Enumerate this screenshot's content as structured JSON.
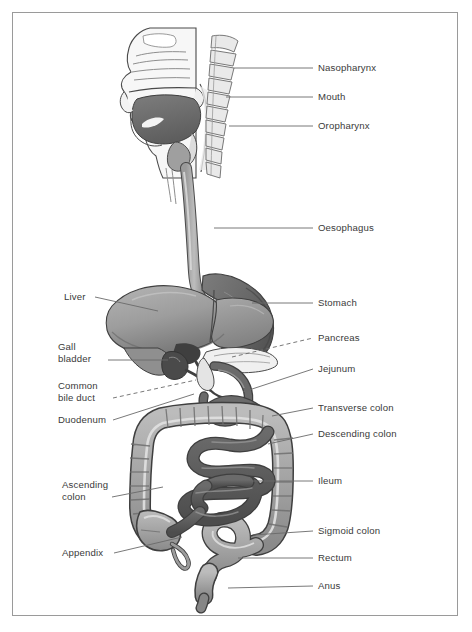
{
  "figure": {
    "frame_color": "#9a9a9a",
    "background": "#ffffff",
    "text_color": "#3a3a3a",
    "leader_color": "#6a6a6a"
  },
  "palette": {
    "colon_light": "#a9a9a9",
    "colon_shade": "#8d8d8d",
    "colon_highlight": "#d9d9d9",
    "ileum_dark": "#5d5d5d",
    "ileum_shade": "#4a4a4a",
    "liver": "#a0a0a0",
    "liver_dark": "#7e7e7e",
    "stomach": "#6f6f6f",
    "stomach_dark": "#5a5a5a",
    "tongue": "#707070",
    "outline": "#4a4a4a",
    "head_fill": "#f2f2f2",
    "vertebra": "#e3e3e3"
  },
  "labels": {
    "right": [
      {
        "id": "nasopharynx",
        "text": "Nasopharynx",
        "x": 318,
        "y": 62,
        "leader": {
          "type": "solid",
          "x1": 234,
          "y1": 68,
          "x2": 313,
          "y2": 68
        }
      },
      {
        "id": "mouth",
        "text": "Mouth",
        "x": 318,
        "y": 91,
        "leader": {
          "type": "solid",
          "x1": 226,
          "y1": 97,
          "x2": 313,
          "y2": 97
        }
      },
      {
        "id": "oropharynx",
        "text": "Oropharynx",
        "x": 318,
        "y": 120,
        "leader": {
          "type": "solid",
          "x1": 229,
          "y1": 126,
          "x2": 313,
          "y2": 126
        }
      },
      {
        "id": "oesophagus",
        "text": "Oesophagus",
        "x": 318,
        "y": 222,
        "leader": {
          "type": "solid",
          "x1": 214,
          "y1": 228,
          "x2": 313,
          "y2": 228
        }
      },
      {
        "id": "stomach",
        "text": "Stomach",
        "x": 318,
        "y": 297,
        "leader": {
          "type": "solid",
          "x1": 252,
          "y1": 303,
          "x2": 313,
          "y2": 303
        }
      },
      {
        "id": "pancreas",
        "text": "Pancreas",
        "x": 318,
        "y": 332,
        "leader": {
          "type": "dashed",
          "x1": 232,
          "y1": 357,
          "x2": 313,
          "y2": 338
        }
      },
      {
        "id": "jejunum",
        "text": "Jejunum",
        "x": 318,
        "y": 363,
        "leader": {
          "type": "solid",
          "x1": 243,
          "y1": 392,
          "x2": 313,
          "y2": 369
        }
      },
      {
        "id": "transverse-colon",
        "text": "Transverse colon",
        "x": 318,
        "y": 402,
        "leader": {
          "type": "solid",
          "x1": 272,
          "y1": 416,
          "x2": 313,
          "y2": 408
        }
      },
      {
        "id": "descending-colon",
        "text": "Descending colon",
        "x": 318,
        "y": 428,
        "leader": {
          "type": "solid",
          "x1": 268,
          "y1": 444,
          "x2": 313,
          "y2": 434
        }
      },
      {
        "id": "ileum",
        "text": "Ileum",
        "x": 318,
        "y": 475,
        "leader": {
          "type": "solid",
          "x1": 252,
          "y1": 481,
          "x2": 313,
          "y2": 481
        }
      },
      {
        "id": "sigmoid-colon",
        "text": "Sigmoid colon",
        "x": 318,
        "y": 525,
        "leader": {
          "type": "solid",
          "x1": 253,
          "y1": 535,
          "x2": 313,
          "y2": 531
        }
      },
      {
        "id": "rectum",
        "text": "Rectum",
        "x": 318,
        "y": 552,
        "leader": {
          "type": "solid",
          "x1": 238,
          "y1": 558,
          "x2": 313,
          "y2": 558
        }
      },
      {
        "id": "anus",
        "text": "Anus",
        "x": 318,
        "y": 580,
        "leader": {
          "type": "solid",
          "x1": 228,
          "y1": 588,
          "x2": 313,
          "y2": 586
        }
      }
    ],
    "left": [
      {
        "id": "liver",
        "text": "Liver",
        "x": 64,
        "y": 291,
        "leader": {
          "type": "solid",
          "x1": 95,
          "y1": 297,
          "x2": 158,
          "y2": 311
        }
      },
      {
        "id": "gall-bladder",
        "text": "Gall\nbladder",
        "x": 58,
        "y": 341,
        "leader": {
          "type": "solid",
          "x1": 108,
          "y1": 360,
          "x2": 168,
          "y2": 360
        }
      },
      {
        "id": "common-bile-duct",
        "text": "Common\nbile duct",
        "x": 58,
        "y": 380,
        "leader": {
          "type": "dashed",
          "x1": 113,
          "y1": 398,
          "x2": 196,
          "y2": 380
        }
      },
      {
        "id": "duodenum",
        "text": "Duodenum",
        "x": 58,
        "y": 414,
        "leader": {
          "type": "solid",
          "x1": 113,
          "y1": 420,
          "x2": 194,
          "y2": 394
        }
      },
      {
        "id": "ascending-colon",
        "text": "Ascending\ncolon",
        "x": 62,
        "y": 479,
        "leader": {
          "type": "solid",
          "x1": 112,
          "y1": 497,
          "x2": 163,
          "y2": 487
        }
      },
      {
        "id": "appendix",
        "text": "Appendix",
        "x": 62,
        "y": 547,
        "leader": {
          "type": "solid",
          "x1": 114,
          "y1": 553,
          "x2": 182,
          "y2": 537
        }
      }
    ]
  }
}
